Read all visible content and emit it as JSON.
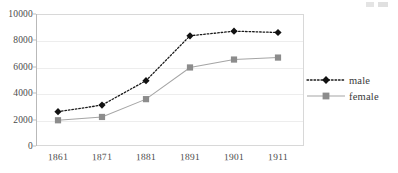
{
  "chart_data": {
    "type": "line",
    "title": "",
    "xlabel": "",
    "ylabel": "",
    "categories": [
      "1861",
      "1871",
      "1881",
      "1891",
      "1901",
      "1911"
    ],
    "x": [
      1861,
      1871,
      1881,
      1891,
      1901,
      1911
    ],
    "series": [
      {
        "name": "male",
        "values": [
          2600,
          3100,
          4950,
          8350,
          8700,
          8600
        ],
        "marker": "diamond",
        "linestyle": "dotted",
        "color": "#1a1a1a"
      },
      {
        "name": "female",
        "values": [
          1950,
          2200,
          3550,
          5950,
          6550,
          6700
        ],
        "marker": "square",
        "linestyle": "solid",
        "color": "#8c8c8c"
      }
    ],
    "ylim": [
      0,
      10000
    ],
    "yticks": [
      0,
      2000,
      4000,
      6000,
      8000,
      10000
    ],
    "ytick_labels": [
      "0",
      "2000",
      "4000",
      "6000",
      "8000",
      "10000"
    ],
    "grid": true,
    "legend_position": "right"
  },
  "legend": {
    "entries": [
      {
        "label": "male",
        "marker": "diamond-marker",
        "line": "dotted-line"
      },
      {
        "label": "female",
        "marker": "square-marker",
        "line": "solid-line"
      }
    ]
  },
  "colors": {
    "male": "#1a1a1a",
    "female": "#8c8c8c",
    "axis": "#b9b9b9",
    "grid": "#ededed",
    "text": "#4a4a4a"
  }
}
